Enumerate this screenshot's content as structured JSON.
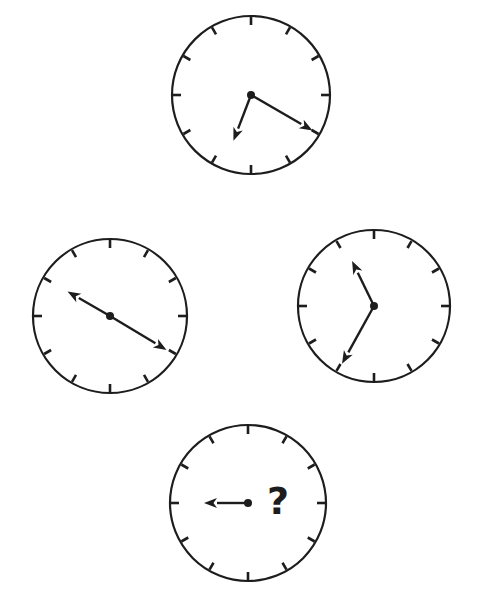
{
  "page": {
    "background_color": "#ffffff",
    "ink_color": "#1d1d1d",
    "width": 488,
    "height": 600
  },
  "style": {
    "tick_count": 12,
    "tick_length": 9,
    "hub_radius": 4,
    "arrow_head_length": 13,
    "arrow_head_half_width": 5
  },
  "clocks": [
    {
      "id": "clock-top",
      "position_label": "top",
      "cx": 251,
      "cy": 95,
      "r": 79,
      "has_question_mark": false,
      "question_mark": "",
      "hands": [
        {
          "name": "hour-hand",
          "angle_deg": 201,
          "length": 49,
          "clock_position": "6.7"
        },
        {
          "name": "minute-hand",
          "angle_deg": 120,
          "length": 71,
          "clock_position": "4"
        }
      ]
    },
    {
      "id": "clock-left",
      "position_label": "left",
      "cx": 110,
      "cy": 316,
      "r": 77,
      "has_question_mark": false,
      "question_mark": "",
      "hands": [
        {
          "name": "hour-hand",
          "angle_deg": 300,
          "length": 49,
          "clock_position": "10"
        },
        {
          "name": "minute-hand",
          "angle_deg": 121,
          "length": 66,
          "clock_position": "4"
        }
      ]
    },
    {
      "id": "clock-right",
      "position_label": "right",
      "cx": 374,
      "cy": 306,
      "r": 76,
      "has_question_mark": false,
      "question_mark": "",
      "hands": [
        {
          "name": "hour-hand",
          "angle_deg": 334,
          "length": 50,
          "clock_position": "11.1"
        },
        {
          "name": "minute-hand",
          "angle_deg": 209,
          "length": 66,
          "clock_position": "7"
        }
      ]
    },
    {
      "id": "clock-bottom",
      "position_label": "bottom",
      "cx": 248,
      "cy": 503,
      "r": 78,
      "has_question_mark": true,
      "question_mark": "?",
      "question_mark_x": 278,
      "question_mark_y": 503,
      "hands": [
        {
          "name": "hour-hand",
          "angle_deg": 270,
          "length": 44,
          "clock_position": "9"
        }
      ]
    }
  ]
}
